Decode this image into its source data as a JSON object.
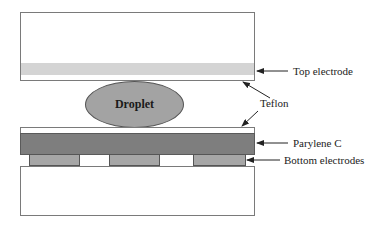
{
  "diagram": {
    "title": "",
    "droplet_label": "Droplet",
    "labels": {
      "top_electrode": "Top electrode",
      "teflon": "Teflon",
      "parylene": "Parylene C",
      "bottom_electrodes": "Bottom electrodes"
    },
    "colors": {
      "top_electrode": "#d4d4d4",
      "droplet": "#a3a3a3",
      "parylene": "#7e7e7e",
      "bottom_electrode": "#a6a6a6",
      "outline": "#7a7a7a"
    },
    "bottom_electrode_count": 3
  }
}
